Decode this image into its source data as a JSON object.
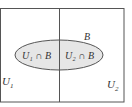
{
  "diagram": {
    "labels": {
      "u1": "U",
      "u1_sub": "1",
      "u2": "U",
      "u2_sub": "2",
      "b": "B",
      "inter1": "U₁ ∩ B",
      "inter2": "U₂ ∩ B"
    },
    "colors": {
      "border": "#555555",
      "ellipse_fill": "#e6e6e6",
      "ellipse_stroke": "#555555",
      "text": "#333333"
    }
  }
}
